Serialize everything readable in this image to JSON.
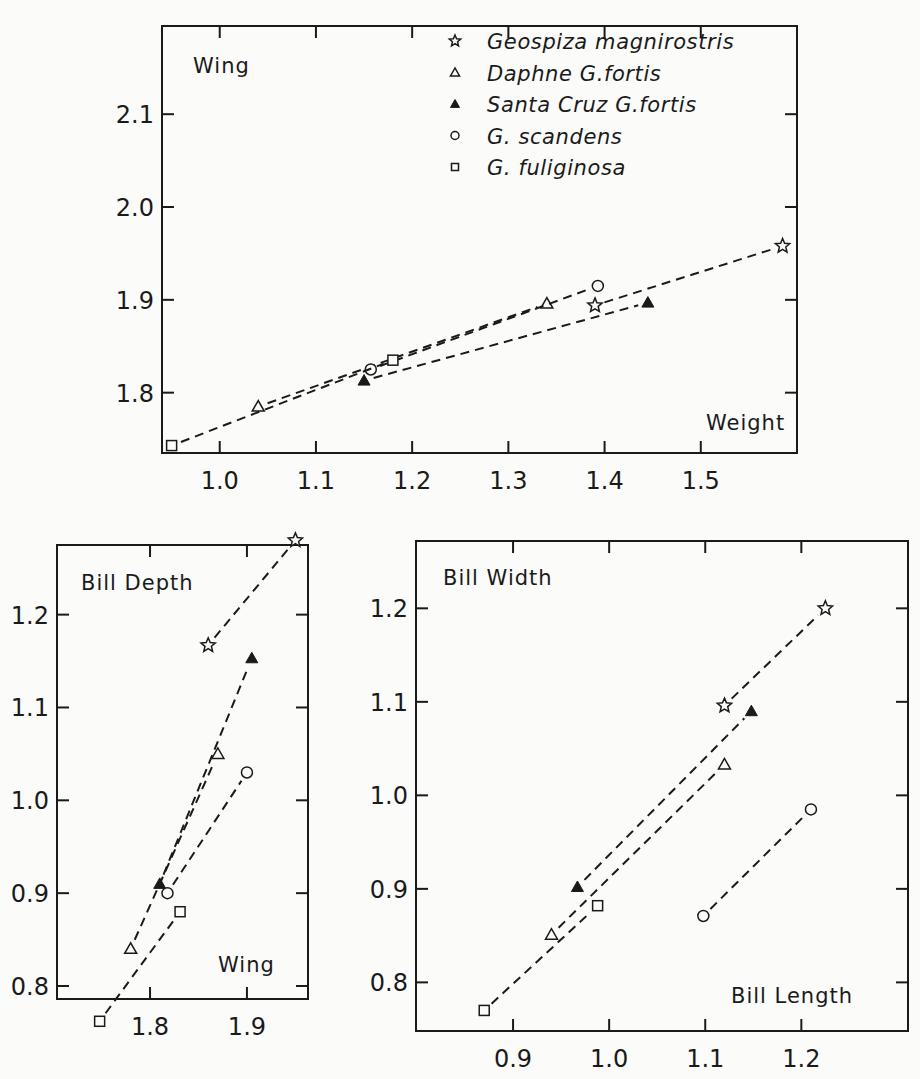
{
  "figure": {
    "legend": [
      {
        "marker": "star",
        "label": "Geospiza magnirostris"
      },
      {
        "marker": "triangle-open",
        "label": "Daphne G.fortis"
      },
      {
        "marker": "triangle-filled",
        "label": "Santa Cruz G.fortis"
      },
      {
        "marker": "circle-open",
        "label": "G. scandens"
      },
      {
        "marker": "square-open",
        "label": "G. fuliginosa"
      }
    ]
  },
  "chart_data": [
    {
      "id": "wing-vs-weight",
      "type": "line",
      "title": "",
      "xlabel": "Weight",
      "ylabel": "Wing",
      "xticks": [
        "1.0",
        "1.1",
        "1.2",
        "1.3",
        "1.4",
        "1.5"
      ],
      "yticks": [
        "1.8",
        "1.9",
        "2.0",
        "2.1"
      ],
      "xlim": [
        0.94,
        1.6
      ],
      "ylim": [
        1.735,
        2.195
      ],
      "grid": false,
      "legend_position": "upper right",
      "series": [
        {
          "name": "Geospiza magnirostris",
          "marker": "star",
          "x": [
            1.39,
            1.585
          ],
          "y": [
            1.894,
            1.958
          ]
        },
        {
          "name": "Daphne G.fortis",
          "marker": "triangle-open",
          "x": [
            1.04,
            1.34
          ],
          "y": [
            1.785,
            1.896
          ]
        },
        {
          "name": "Santa Cruz G.fortis",
          "marker": "triangle-filled",
          "x": [
            1.15,
            1.445
          ],
          "y": [
            1.813,
            1.897
          ]
        },
        {
          "name": "G. scandens",
          "marker": "circle-open",
          "x": [
            1.157,
            1.393
          ],
          "y": [
            1.825,
            1.915
          ]
        },
        {
          "name": "G. fuliginosa",
          "marker": "square-open",
          "x": [
            0.95,
            1.18
          ],
          "y": [
            1.743,
            1.835
          ]
        }
      ]
    },
    {
      "id": "bill-depth-vs-wing",
      "type": "line",
      "title": "",
      "xlabel": "Wing",
      "ylabel": "Bill Depth",
      "xticks": [
        "1.8",
        "1.9"
      ],
      "yticks": [
        "0.8",
        "0.9",
        "1.0",
        "1.1",
        "1.2"
      ],
      "xlim": [
        1.704,
        1.963
      ],
      "ylim": [
        0.786,
        1.275
      ],
      "grid": false,
      "series": [
        {
          "name": "Geospiza magnirostris",
          "marker": "star",
          "x": [
            1.86,
            1.95
          ],
          "y": [
            1.167,
            1.28
          ]
        },
        {
          "name": "Daphne G.fortis",
          "marker": "triangle-open",
          "x": [
            1.78,
            1.87
          ],
          "y": [
            0.84,
            1.05
          ]
        },
        {
          "name": "Santa Cruz G.fortis",
          "marker": "triangle-filled",
          "x": [
            1.81,
            1.905
          ],
          "y": [
            0.91,
            1.153
          ]
        },
        {
          "name": "G. scandens",
          "marker": "circle-open",
          "x": [
            1.818,
            1.9
          ],
          "y": [
            0.9,
            1.03
          ]
        },
        {
          "name": "G. fuliginosa",
          "marker": "square-open",
          "x": [
            1.748,
            1.831
          ],
          "y": [
            0.762,
            0.88
          ]
        }
      ]
    },
    {
      "id": "bill-width-vs-bill-length",
      "type": "line",
      "title": "",
      "xlabel": "Bill Length",
      "ylabel": "Bill Width",
      "xticks": [
        "0.9",
        "1.0",
        "1.1",
        "1.2"
      ],
      "yticks": [
        "0.8",
        "0.9",
        "1.0",
        "1.1",
        "1.2"
      ],
      "xlim": [
        0.799,
        1.311
      ],
      "ylim": [
        0.748,
        1.272
      ],
      "grid": false,
      "series": [
        {
          "name": "Geospiza magnirostris",
          "marker": "star",
          "x": [
            1.12,
            1.225
          ],
          "y": [
            1.096,
            1.2
          ]
        },
        {
          "name": "Daphne G.fortis",
          "marker": "triangle-open",
          "x": [
            0.94,
            1.12
          ],
          "y": [
            0.851,
            1.033
          ]
        },
        {
          "name": "Santa Cruz G.fortis",
          "marker": "triangle-filled",
          "x": [
            0.967,
            1.148
          ],
          "y": [
            0.902,
            1.09
          ]
        },
        {
          "name": "G. scandens",
          "marker": "circle-open",
          "x": [
            1.098,
            1.21
          ],
          "y": [
            0.871,
            0.985
          ]
        },
        {
          "name": "G. fuliginosa",
          "marker": "square-open",
          "x": [
            0.87,
            0.988
          ],
          "y": [
            0.77,
            0.882
          ]
        }
      ]
    }
  ]
}
